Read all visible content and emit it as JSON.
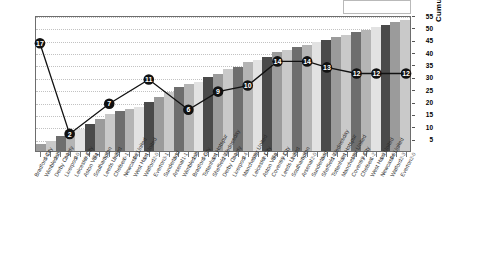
{
  "chart_data": {
    "type": "bar",
    "title": "",
    "xlabel": "",
    "ylabel": "Cumulative Points",
    "ylim": [
      0,
      55
    ],
    "ytick_values": [
      5,
      10,
      15,
      20,
      25,
      30,
      35,
      40,
      45,
      50,
      55
    ],
    "grid": true,
    "legend": "none",
    "categories": [
      "Bradford City",
      "Wimbledon",
      "Derby County",
      "Liverpool",
      "Leicester City",
      "Aston Villa",
      "Southampton",
      "Leeds United",
      "Chelsea",
      "Newcastle United",
      "West Ham United",
      "Watford",
      "Everton",
      "Sunderland",
      "Arsenal",
      "Wimbledon",
      "Bradford City",
      "Tottenham Hotspur",
      "Sheffield Wednesday",
      "Derby County",
      "Liverpool",
      "Manchester United",
      "Leicester City",
      "Aston Villa",
      "Coventry City",
      "Leeds United",
      "Southampton",
      "Arsenal",
      "Sunderland",
      "Sheffield Wednesday",
      "Tottenham Hotspur",
      "Manchester United",
      "Coventry City",
      "Chelsea",
      "West Ham United",
      "Newcastle United",
      "Watford",
      "Everton"
    ],
    "scores": [
      "0-1",
      "3-2",
      "3-1",
      "1-0",
      "0-3",
      "0-1",
      "3-2",
      "0-2",
      "0-1",
      "1-2",
      "1-1",
      "2-0",
      "3-1",
      "2-1",
      "1-1",
      "1-3",
      "0-0",
      "1-1",
      "2-1",
      "0-1",
      "1-4",
      "0-0",
      "1-1",
      "0-0",
      "0-1",
      "1-2",
      "0-3",
      "2-0",
      "0-0",
      "1-1",
      "2-1",
      "1-0",
      "3-4",
      "1-2",
      "1-3",
      "1-0",
      "2-3",
      "2-0"
    ],
    "series": [
      {
        "name": "Cumulative Points",
        "type": "bar",
        "values": [
          3,
          4,
          6,
          8,
          9,
          11,
          13,
          15,
          16,
          17,
          18,
          20,
          22,
          24,
          26,
          27,
          28,
          30,
          31,
          33,
          34,
          36,
          37,
          38,
          40,
          41,
          42,
          43,
          44,
          45,
          46,
          47,
          48,
          49,
          50,
          51,
          52,
          53
        ]
      },
      {
        "name": "League Position",
        "type": "line",
        "label_points": [
          {
            "index": 0,
            "value": 17
          },
          {
            "index": 3,
            "value": 2
          },
          {
            "index": 7,
            "value": 7
          },
          {
            "index": 11,
            "value": 11
          },
          {
            "index": 15,
            "value": 6
          },
          {
            "index": 18,
            "value": 9
          },
          {
            "index": 21,
            "value": 10
          },
          {
            "index": 24,
            "value": 14
          },
          {
            "index": 27,
            "value": 14
          },
          {
            "index": 29,
            "value": 13
          },
          {
            "index": 32,
            "value": 12
          },
          {
            "index": 34,
            "value": 12
          },
          {
            "index": 37,
            "value": 12
          }
        ]
      }
    ]
  },
  "colors": {
    "line": "#111111",
    "marker_fill": "#111111",
    "marker_text": "#ffffff",
    "frame": "#6d6d6d",
    "grid": "#c2c2c2",
    "bar_palette": [
      "#9b9b9b",
      "#c9c9c9",
      "#6e6e6e",
      "#b4b4b4",
      "#e2e2e2",
      "#4a4a4a"
    ]
  }
}
